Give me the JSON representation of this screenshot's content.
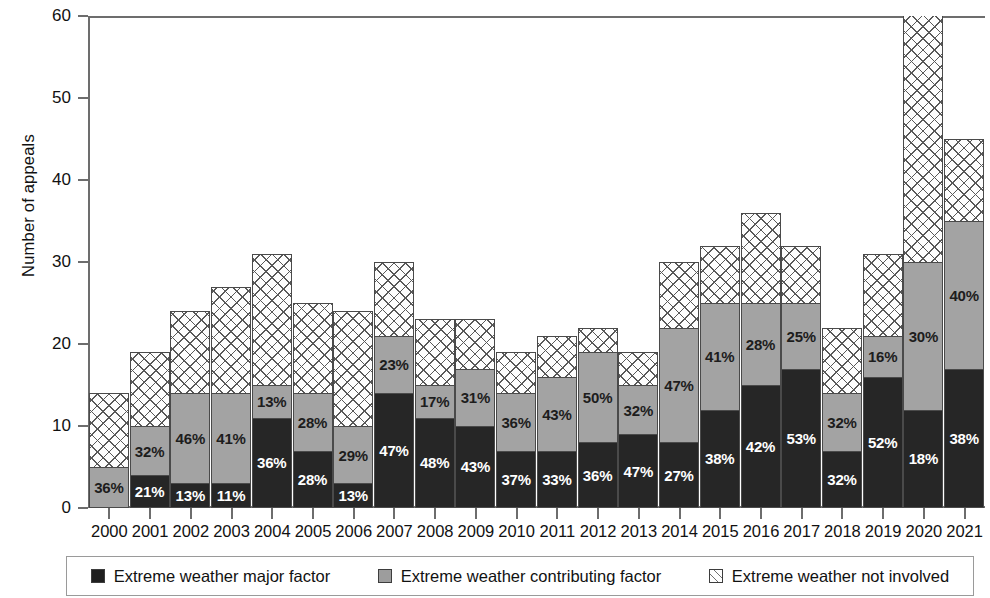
{
  "chart_data": {
    "type": "bar",
    "subtype": "stacked-bar",
    "title": "",
    "xlabel": "",
    "ylabel": "Number of appeals",
    "ylim": [
      0,
      60
    ],
    "ytick_values": [
      0,
      10,
      20,
      30,
      40,
      50,
      60
    ],
    "ytick_labels": [
      "0",
      "10",
      "20",
      "30",
      "40",
      "50",
      "60"
    ],
    "grid": false,
    "legend_position": "bottom",
    "categories": [
      "2000",
      "2001",
      "2002",
      "2003",
      "2004",
      "2005",
      "2006",
      "2007",
      "2008",
      "2009",
      "2010",
      "2011",
      "2012",
      "2013",
      "2014",
      "2015",
      "2016",
      "2017",
      "2018",
      "2019",
      "2020",
      "2021"
    ],
    "series": [
      {
        "name": "Extreme weather major factor",
        "color": "#262626",
        "pattern": "solid-black",
        "values": [
          0,
          4,
          3,
          3,
          11,
          7,
          3,
          14,
          11,
          10,
          7,
          7,
          8,
          9,
          8,
          12,
          15,
          17,
          7,
          16,
          12,
          17
        ],
        "percent_labels": [
          "",
          "21%",
          "13%",
          "11%",
          "36%",
          "28%",
          "13%",
          "47%",
          "48%",
          "43%",
          "37%",
          "33%",
          "36%",
          "47%",
          "27%",
          "38%",
          "42%",
          "53%",
          "32%",
          "52%",
          "18%",
          "38%"
        ]
      },
      {
        "name": "Extreme weather contributing factor",
        "color": "#a3a3a3",
        "pattern": "solid-gray",
        "values": [
          5,
          6,
          11,
          11,
          4,
          7,
          7,
          7,
          4,
          7,
          7,
          9,
          11,
          6,
          14,
          13,
          10,
          8,
          7,
          5,
          18,
          18
        ],
        "percent_labels": [
          "36%",
          "32%",
          "46%",
          "41%",
          "13%",
          "28%",
          "29%",
          "23%",
          "17%",
          "31%",
          "36%",
          "43%",
          "50%",
          "32%",
          "47%",
          "41%",
          "28%",
          "25%",
          "32%",
          "16%",
          "30%",
          "40%"
        ]
      },
      {
        "name": "Extreme weather not involved",
        "color": "#fdfdfd",
        "pattern": "cross-hatch",
        "values": [
          9,
          9,
          10,
          13,
          16,
          11,
          14,
          9,
          8,
          6,
          5,
          5,
          3,
          4,
          8,
          7,
          11,
          7,
          8,
          10,
          35,
          10
        ],
        "percent_labels": [
          "",
          "",
          "",
          "",
          "",
          "",
          "",
          "",
          "",
          "",
          "",
          "",
          "",
          "",
          "",
          "",
          "",
          "",
          "",
          "",
          "",
          ""
        ]
      }
    ],
    "totals": [
      14,
      19,
      24,
      27,
      31,
      25,
      24,
      30,
      23,
      23,
      19,
      21,
      22,
      19,
      30,
      32,
      36,
      32,
      22,
      31,
      65,
      45
    ]
  },
  "legend": {
    "items": [
      {
        "label": "Extreme weather major factor",
        "swatch": "black"
      },
      {
        "label": "Extreme weather contributing factor",
        "swatch": "gray"
      },
      {
        "label": "Extreme weather not involved",
        "swatch": "hatch"
      }
    ]
  }
}
